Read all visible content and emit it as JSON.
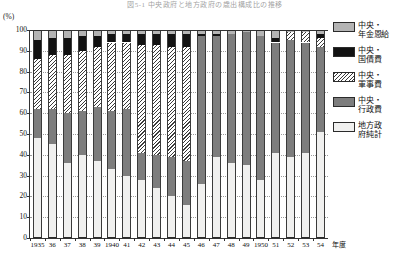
{
  "title": "図5-1 中央政府と地方政府の歳出構成比の推移",
  "axis": {
    "unit_label": "(%)",
    "y_ticks": [
      0,
      10,
      20,
      30,
      40,
      50,
      60,
      70,
      80,
      90,
      100
    ],
    "x_suffix_label": "年度",
    "x_tick_labels": [
      "1935",
      "36",
      "37",
      "38",
      "39",
      "1940",
      "41",
      "42",
      "43",
      "44",
      "45",
      "46",
      "47",
      "48",
      "49",
      "1950",
      "51",
      "52",
      "53",
      "54"
    ]
  },
  "legend": {
    "position": "right",
    "items": [
      {
        "name": "中央・\n年金恩給",
        "key": "pension",
        "color": "#b4b4b4",
        "pattern": "solid-gray"
      },
      {
        "name": "中央・\n国債費",
        "key": "bond",
        "color": "#121212",
        "pattern": "solid-black"
      },
      {
        "name": "中央・\n軍事費",
        "key": "military",
        "color": "#ffffff",
        "pattern": "diagonal-hatch"
      },
      {
        "name": "中央・\n行政費",
        "key": "admin",
        "color": "#7d7d7d",
        "pattern": "solid-darkgray"
      },
      {
        "name": "地方政\n府純計",
        "key": "local",
        "color": "#f0f0ef",
        "pattern": "solid-white"
      }
    ]
  },
  "chart_data": {
    "type": "bar",
    "stacked": true,
    "title": "図5-1 中央政府と地方政府の歳出構成比の推移",
    "xlabel": "年度",
    "ylabel": "(%)",
    "ylim": [
      0,
      100
    ],
    "grid": true,
    "legend_position": "right",
    "categories": [
      "1935",
      "36",
      "37",
      "38",
      "39",
      "1940",
      "41",
      "42",
      "43",
      "44",
      "45",
      "46",
      "47",
      "48",
      "49",
      "1950",
      "51",
      "52",
      "53",
      "54"
    ],
    "series": [
      {
        "name": "地方政府純計",
        "key": "local",
        "values": [
          48,
          45,
          36,
          40,
          37,
          33,
          30,
          28,
          24,
          20,
          16,
          26,
          39,
          36,
          35,
          28,
          41,
          39,
          41,
          51
        ]
      },
      {
        "name": "中央・行政費",
        "key": "admin",
        "values": [
          14,
          17,
          24,
          21,
          26,
          28,
          32,
          13,
          16,
          19,
          21,
          71,
          58,
          62,
          64,
          69,
          53,
          56,
          53,
          41
        ]
      },
      {
        "name": "中央・軍事費",
        "key": "military",
        "values": [
          24,
          26,
          28,
          29,
          29,
          33,
          32,
          52,
          53,
          53,
          55,
          0,
          0,
          0,
          0,
          0,
          0,
          4,
          5,
          4
        ]
      },
      {
        "name": "中央・国債費",
        "key": "bond",
        "values": [
          9,
          8,
          8,
          7,
          5,
          4,
          4,
          5,
          5,
          6,
          6,
          1,
          1,
          0,
          0,
          0,
          2,
          0,
          0,
          2
        ]
      },
      {
        "name": "中央・年金恩給",
        "key": "pension",
        "values": [
          5,
          4,
          4,
          3,
          3,
          2,
          2,
          2,
          2,
          2,
          2,
          2,
          2,
          2,
          1,
          3,
          4,
          1,
          1,
          2
        ]
      }
    ]
  }
}
